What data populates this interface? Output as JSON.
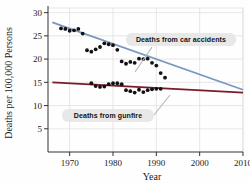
{
  "chart_data": {
    "type": "scatter",
    "title": "",
    "xlabel": "Year",
    "ylabel": "Deaths per 100,000 Persons",
    "xlim": [
      1965,
      2010
    ],
    "ylim": [
      0,
      31
    ],
    "xticks": [
      1970,
      1980,
      1990,
      2000,
      2010
    ],
    "xticklabels": [
      "1970",
      "1980",
      "1990",
      "2000",
      "2010"
    ],
    "yticks": [
      5,
      10,
      15,
      20,
      25,
      30
    ],
    "yticklabels": [
      "5",
      "10",
      "15",
      "20",
      "25",
      "30"
    ],
    "grid": true,
    "legend_position": "annotations",
    "annotations": [
      {
        "label": "Deaths from car accidents",
        "x": 1993,
        "y": 22.0
      },
      {
        "label": "Deaths from gunfire",
        "x": 1983,
        "y": 10.2
      }
    ],
    "series": [
      {
        "name": "Deaths from car accidents",
        "marker": "filled-circle",
        "marker_color": "#111111",
        "trend_color": "#7b96bf",
        "trend": {
          "x": [
            1966.0,
            2010.0
          ],
          "y": [
            27.9,
            13.4
          ]
        },
        "points": [
          {
            "x": 1968,
            "y": 26.6
          },
          {
            "x": 1969,
            "y": 26.5
          },
          {
            "x": 1970,
            "y": 26.1
          },
          {
            "x": 1971,
            "y": 26.2
          },
          {
            "x": 1972,
            "y": 26.5
          },
          {
            "x": 1973,
            "y": 25.5
          },
          {
            "x": 1974,
            "y": 21.9
          },
          {
            "x": 1975,
            "y": 21.6
          },
          {
            "x": 1976,
            "y": 22.1
          },
          {
            "x": 1977,
            "y": 22.6
          },
          {
            "x": 1978,
            "y": 23.4
          },
          {
            "x": 1979,
            "y": 23.2
          },
          {
            "x": 1980,
            "y": 23.0
          },
          {
            "x": 1981,
            "y": 22.0
          },
          {
            "x": 1982,
            "y": 19.5
          },
          {
            "x": 1983,
            "y": 19.0
          },
          {
            "x": 1984,
            "y": 19.4
          },
          {
            "x": 1985,
            "y": 19.2
          },
          {
            "x": 1986,
            "y": 20.1
          },
          {
            "x": 1987,
            "y": 20.0
          },
          {
            "x": 1988,
            "y": 20.1
          },
          {
            "x": 1989,
            "y": 19.2
          },
          {
            "x": 1990,
            "y": 18.6
          },
          {
            "x": 1991,
            "y": 17.0
          },
          {
            "x": 1992,
            "y": 16.0
          }
        ]
      },
      {
        "name": "Deaths from gunfire",
        "marker": "filled-circle",
        "marker_color": "#111111",
        "trend_color": "#7a1b2a",
        "trend": {
          "x": [
            1966.0,
            2010.0
          ],
          "y": [
            15.0,
            12.8
          ]
        },
        "points": [
          {
            "x": 1975,
            "y": 14.8
          },
          {
            "x": 1976,
            "y": 14.2
          },
          {
            "x": 1977,
            "y": 14.0
          },
          {
            "x": 1978,
            "y": 14.1
          },
          {
            "x": 1979,
            "y": 14.6
          },
          {
            "x": 1980,
            "y": 14.8
          },
          {
            "x": 1981,
            "y": 14.8
          },
          {
            "x": 1982,
            "y": 14.6
          },
          {
            "x": 1983,
            "y": 13.3
          },
          {
            "x": 1984,
            "y": 13.1
          },
          {
            "x": 1985,
            "y": 12.8
          },
          {
            "x": 1986,
            "y": 13.4
          },
          {
            "x": 1987,
            "y": 12.9
          },
          {
            "x": 1988,
            "y": 13.3
          },
          {
            "x": 1989,
            "y": 13.5
          },
          {
            "x": 1990,
            "y": 13.6
          },
          {
            "x": 1991,
            "y": 13.6
          }
        ]
      }
    ]
  },
  "colors": {
    "grid": "#dddddd",
    "axis": "#333333",
    "marker": "#111111",
    "car_trend": "#7b96bf",
    "gun_trend": "#7a1b2a",
    "callout_bg": "#e6e6e6",
    "leader": "#b9b9b9"
  }
}
